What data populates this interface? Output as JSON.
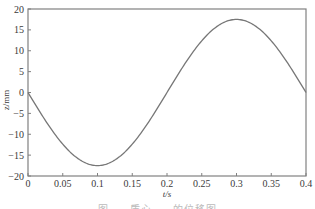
{
  "chart_data": {
    "type": "line",
    "title": "",
    "xlabel": "t/s",
    "ylabel": "z/mm",
    "xlim": [
      0,
      0.4
    ],
    "ylim": [
      -20,
      20
    ],
    "x_ticks": [
      0,
      0.05,
      0.1,
      0.15,
      0.2,
      0.25,
      0.3,
      0.35,
      0.4
    ],
    "x_tick_labels": [
      "0",
      "0.05",
      "0.1",
      "0.15",
      "0.2",
      "0.25",
      "0.3",
      "0.35",
      "0.4"
    ],
    "y_ticks": [
      -20,
      -15,
      -10,
      -5,
      0,
      5,
      10,
      15,
      20
    ],
    "y_tick_labels": [
      "-20",
      "-15",
      "-10",
      "-5",
      "0",
      "5",
      "10",
      "15",
      "20"
    ],
    "grid": false,
    "legend": null,
    "series": [
      {
        "name": "z",
        "color": "#777777",
        "x": [
          0,
          0.025,
          0.05,
          0.075,
          0.1,
          0.125,
          0.15,
          0.175,
          0.2,
          0.225,
          0.25,
          0.275,
          0.3,
          0.325,
          0.35,
          0.375,
          0.4
        ],
        "values": [
          0,
          -6.7,
          -12.4,
          -16.2,
          -17.5,
          -16.2,
          -12.4,
          -6.7,
          0,
          6.7,
          12.4,
          16.2,
          17.5,
          16.2,
          12.4,
          6.7,
          0
        ]
      }
    ]
  },
  "caption": "图 ... 质心 ... 的位移图"
}
